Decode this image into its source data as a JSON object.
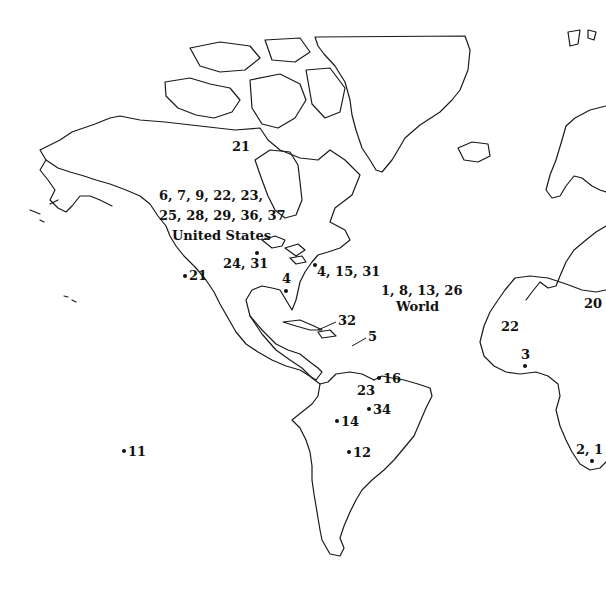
{
  "map": {
    "type": "outline world map (Americas, Greenland, western Europe and Africa)",
    "colors": {
      "land_outline": "#1a1a1a",
      "background": "#ffffff",
      "text": "#111111"
    },
    "regions": {
      "usa": {
        "codes_line1": "6, 7, 9, 22, 23,",
        "codes_line2": "25, 28, 29, 36, 37",
        "name": "United States"
      },
      "world": {
        "codes": "1, 8, 13, 26",
        "name": "World"
      }
    },
    "markers": [
      {
        "id": "m21-arctic",
        "label": "21",
        "dot": false
      },
      {
        "id": "m24-31",
        "label": "24, 31",
        "dot": true
      },
      {
        "id": "m21-west",
        "label": "21",
        "dot": true
      },
      {
        "id": "m4-south",
        "label": "4",
        "dot": true
      },
      {
        "id": "m4-15-31",
        "label": "4, 15, 31",
        "dot": true
      },
      {
        "id": "m32",
        "label": "32",
        "dot": false
      },
      {
        "id": "m5",
        "label": "5",
        "dot": false
      },
      {
        "id": "m16",
        "label": "16",
        "dot": true
      },
      {
        "id": "m23",
        "label": "23",
        "dot": false
      },
      {
        "id": "m34",
        "label": "34",
        "dot": true
      },
      {
        "id": "m14",
        "label": "14",
        "dot": true
      },
      {
        "id": "m12",
        "label": "12",
        "dot": true
      },
      {
        "id": "m11",
        "label": "11",
        "dot": true
      },
      {
        "id": "m22-africa",
        "label": "22",
        "dot": false
      },
      {
        "id": "m20",
        "label": "20",
        "dot": false
      },
      {
        "id": "m3",
        "label": "3",
        "dot": true
      },
      {
        "id": "m2-1",
        "label": "2, 1",
        "dot": true
      }
    ]
  }
}
